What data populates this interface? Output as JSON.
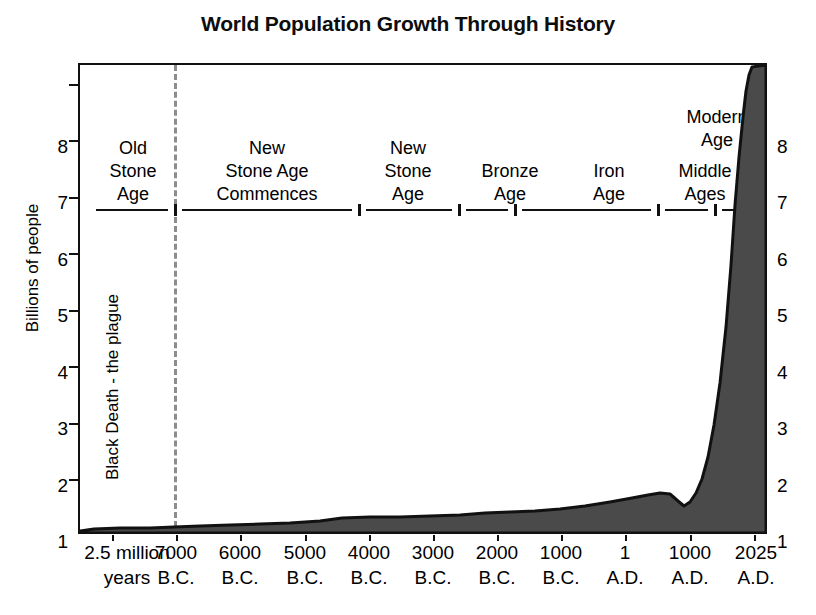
{
  "title": "World Population Growth Through History",
  "axes": {
    "ylabel": "Billions of people",
    "yticks": [
      "1",
      "2",
      "3",
      "4",
      "5",
      "6",
      "7",
      "8"
    ],
    "xticks": [
      {
        "line1": "2.5 million",
        "line2": "years"
      },
      {
        "line1": "7000",
        "line2": "B.C."
      },
      {
        "line1": "6000",
        "line2": "B.C."
      },
      {
        "line1": "5000",
        "line2": "B.C."
      },
      {
        "line1": "4000",
        "line2": "B.C."
      },
      {
        "line1": "3000",
        "line2": "B.C."
      },
      {
        "line1": "2000",
        "line2": "B.C."
      },
      {
        "line1": "1000",
        "line2": "B.C."
      },
      {
        "line1": "1",
        "line2": "A.D."
      },
      {
        "line1": "1000",
        "line2": "A.D."
      },
      {
        "line1": "2025",
        "line2": "A.D."
      }
    ]
  },
  "eras": [
    {
      "name": "old-stone-age",
      "text": "Old\nStone\nAge"
    },
    {
      "name": "new-stone-age-commences",
      "text": "New\nStone Age\nCommences"
    },
    {
      "name": "new-stone-age",
      "text": "New\nStone\nAge"
    },
    {
      "name": "bronze-age",
      "text": "Bronze\nAge"
    },
    {
      "name": "iron-age",
      "text": "Iron\nAge"
    },
    {
      "name": "middle-ages",
      "text": "Middle\nAges"
    },
    {
      "name": "modern-age",
      "text": "Modern\nAge"
    }
  ],
  "annotations": {
    "black_death": "Black Death - the plague"
  },
  "colors": {
    "curve_fill": "#4a4a4a",
    "curve_line": "#111111",
    "axis": "#111111",
    "divider": "#8d8d8d"
  },
  "chart_data": {
    "type": "area",
    "title": "World Population Growth Through History",
    "xlabel": "",
    "ylabel": "Billions of people",
    "ylim": [
      0,
      8.35
    ],
    "grid": false,
    "legend": null,
    "x_tick_labels": [
      "2.5 million years",
      "7000 B.C.",
      "6000 B.C.",
      "5000 B.C.",
      "4000 B.C.",
      "3000 B.C.",
      "2000 B.C.",
      "1000 B.C.",
      "1 A.D.",
      "1000 A.D.",
      "2025 A.D."
    ],
    "y_tick_values": [
      1,
      2,
      3,
      4,
      5,
      6,
      7,
      8
    ],
    "units": "billions of people",
    "x": [
      "2.5 million years ago",
      "8000 B.C.",
      "7000 B.C.",
      "6000 B.C.",
      "5000 B.C.",
      "4000 B.C.",
      "3000 B.C.",
      "2000 B.C.",
      "1000 B.C.",
      "500 B.C.",
      "1 A.D.",
      "500 A.D.",
      "1000 A.D.",
      "1350 A.D.",
      "1400 A.D.",
      "1500 A.D.",
      "1650 A.D.",
      "1750 A.D.",
      "1800 A.D.",
      "1850 A.D.",
      "1900 A.D.",
      "1927 A.D.",
      "1950 A.D.",
      "1960 A.D.",
      "1975 A.D.",
      "1987 A.D.",
      "1999 A.D.",
      "2011 A.D.",
      "2025 A.D."
    ],
    "values": [
      0.0,
      0.01,
      0.02,
      0.03,
      0.04,
      0.05,
      0.07,
      0.1,
      0.12,
      0.15,
      0.2,
      0.21,
      0.27,
      0.37,
      0.35,
      0.43,
      0.55,
      0.72,
      0.91,
      1.2,
      1.6,
      2.0,
      2.5,
      3.0,
      4.0,
      5.0,
      6.0,
      7.0,
      8.2
    ],
    "annotations": [
      {
        "label": "Black Death - the plague",
        "x": "1350 A.D.",
        "note": "population dip"
      }
    ],
    "era_bands": [
      "Old Stone Age",
      "New Stone Age Commences",
      "New Stone Age",
      "Bronze Age",
      "Iron Age",
      "Middle Ages",
      "Modern Age"
    ]
  }
}
